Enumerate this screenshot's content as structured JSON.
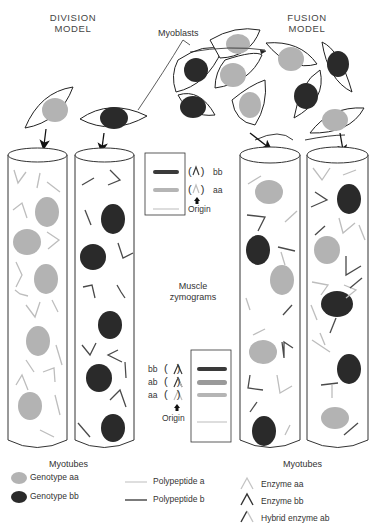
{
  "titles": {
    "division": [
      "DIVISION",
      "MODEL"
    ],
    "fusion": [
      "FUSION",
      "MODEL"
    ]
  },
  "labels": {
    "myoblasts": "Myoblasts",
    "myotubes_left": "Myotubes",
    "myotubes_right": "Myotubes",
    "muscle_zymograms": [
      "Muscle",
      "zymograms"
    ]
  },
  "zymogram_top": {
    "bands": [
      {
        "label": "bb",
        "color": "#3a3a3a"
      },
      {
        "label": "aa",
        "color": "#b5b5b5"
      }
    ],
    "origin": "Origin"
  },
  "zymogram_bottom": {
    "bands": [
      {
        "label": "bb",
        "color": "#3a3a3a"
      },
      {
        "label": "ab",
        "color": "#9a9a9a"
      },
      {
        "label": "aa",
        "color": "#b5b5b5"
      }
    ],
    "origin": "Origin"
  },
  "legend": {
    "genotype_aa": "Genotype aa",
    "genotype_bb": "Genotype bb",
    "polypeptide_a": "Polypeptide a",
    "polypeptide_b": "Polypeptide b",
    "enzyme_aa": "Enzyme aa",
    "enzyme_bb": "Enzyme bb",
    "hybrid_enzyme_ab": "Hybrid enzyme ab"
  },
  "colors": {
    "genotype_aa": "#b3b3b3",
    "genotype_bb": "#2a2a2a",
    "polypeptide_a": "#bdbdbd",
    "polypeptide_b": "#4a4a4a",
    "outline": "#333333"
  }
}
